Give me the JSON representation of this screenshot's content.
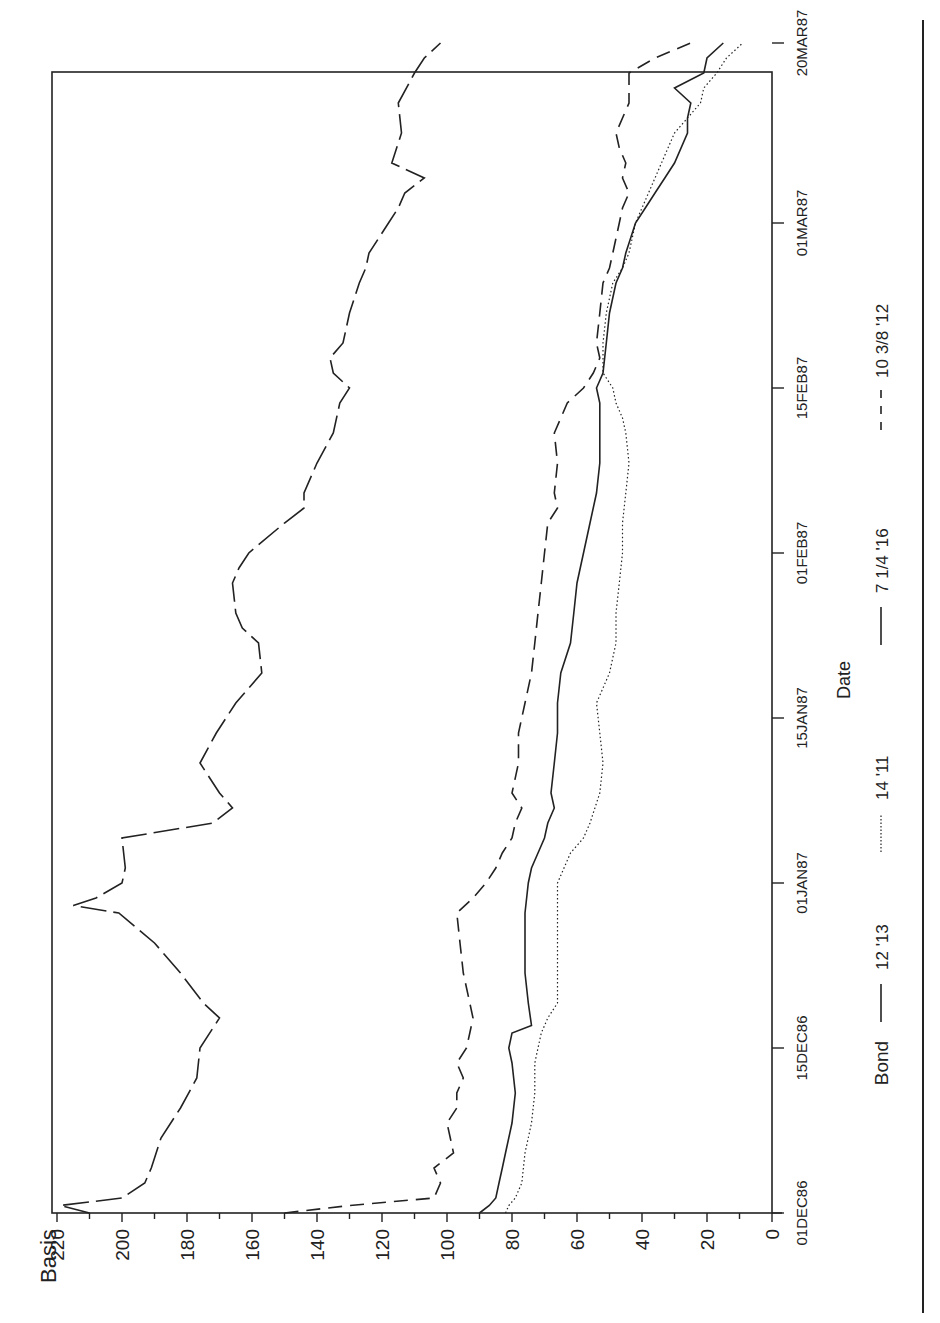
{
  "chart_data": {
    "type": "line",
    "title": "",
    "xlabel": "Date",
    "ylabel": "Basis",
    "orientation": "rotated 90° counter-clockwise (date axis runs bottom-to-top on the right, basis axis along the bottom)",
    "ylim": [
      0,
      220
    ],
    "yticks": [
      0,
      20,
      40,
      60,
      80,
      100,
      120,
      140,
      160,
      180,
      200,
      220
    ],
    "xticks": [
      "01DEC86",
      "15DEC86",
      "01JAN87",
      "15JAN87",
      "01FEB87",
      "15FEB87",
      "01MAR87",
      "20MAR87"
    ],
    "xtick_bday": [
      0,
      11,
      22,
      33,
      44,
      55,
      66,
      78
    ],
    "grid": false,
    "legend_title": "Bond",
    "legend_position": "below x-axis",
    "x_unit": "business day index from 01DEC86",
    "series": [
      {
        "name": "12 '13",
        "style": "solid",
        "x": [
          0,
          0.5,
          1,
          2,
          3,
          4,
          6,
          8,
          10,
          11,
          12,
          12.5,
          14,
          16,
          18,
          20,
          22,
          23,
          24,
          25,
          26,
          27,
          28,
          30,
          32,
          34,
          36,
          38,
          40,
          42,
          44,
          46,
          48,
          50,
          52,
          54,
          55,
          56,
          58,
          60,
          62,
          63,
          64,
          66,
          67,
          68,
          69,
          70,
          72,
          73,
          74,
          75,
          76,
          77,
          78
        ],
        "values": [
          90,
          87,
          85,
          84,
          83,
          82,
          80,
          79,
          80,
          81,
          80,
          74,
          75,
          76,
          76,
          76,
          75,
          74,
          72,
          70,
          69,
          67,
          68,
          67,
          66,
          66,
          65,
          62,
          61,
          60,
          58,
          56,
          54,
          53,
          53,
          53,
          54,
          52,
          51,
          50,
          48,
          46,
          45,
          42,
          39,
          36,
          33,
          30,
          26,
          26,
          25,
          30,
          21,
          20,
          15
        ]
      },
      {
        "name": "14 '11",
        "style": "dotted",
        "x": [
          0,
          0.5,
          1,
          2,
          4,
          6,
          8,
          10,
          11,
          12,
          13,
          14,
          16,
          18,
          20,
          22,
          23,
          24,
          25,
          26,
          28,
          30,
          32,
          34,
          36,
          38,
          40,
          42,
          44,
          46,
          48,
          50,
          52,
          53,
          54,
          55,
          56,
          58,
          60,
          62,
          63,
          64,
          66,
          67,
          68,
          70,
          72,
          74,
          75,
          76,
          77,
          78
        ],
        "values": [
          82,
          81,
          79,
          77,
          76,
          74,
          73,
          73,
          72,
          71,
          69,
          66,
          66,
          66,
          66,
          66,
          64,
          62,
          58,
          56,
          53,
          52,
          53,
          54,
          50,
          48,
          48,
          47,
          46,
          46,
          45,
          44,
          45,
          46,
          48,
          49,
          52,
          52,
          51,
          49,
          46,
          44,
          42,
          40,
          38,
          34,
          30,
          22,
          21,
          17,
          14,
          9
        ]
      },
      {
        "name": "7 1/4 '16",
        "style": "long-dash",
        "x": [
          0,
          0.5,
          1,
          2,
          3,
          5,
          7,
          9,
          11,
          13,
          14,
          16,
          18,
          20,
          20.5,
          21,
          22,
          23,
          25,
          26,
          27,
          28,
          30,
          32,
          34,
          36,
          38,
          39,
          40,
          42,
          43,
          44,
          46,
          47,
          48,
          50,
          52,
          54,
          55,
          56,
          57,
          58,
          60,
          62,
          63,
          64,
          65,
          66,
          67,
          68,
          69,
          70,
          72,
          74,
          76,
          77,
          78
        ],
        "values": [
          210,
          219,
          200,
          193,
          191,
          188,
          182,
          177,
          176,
          170,
          175,
          182,
          190,
          201,
          215,
          208,
          200,
          199,
          200,
          172,
          166,
          170,
          176,
          171,
          165,
          157,
          158,
          163,
          165,
          166,
          164,
          161,
          150,
          144,
          144,
          140,
          135,
          133,
          130,
          135,
          136,
          132,
          130,
          127,
          125,
          124,
          121,
          118,
          115,
          113,
          107,
          117,
          114,
          115,
          110,
          107,
          102
        ]
      },
      {
        "name": "10 3/8 '12",
        "style": "dash",
        "x": [
          0,
          0.5,
          1,
          2,
          3,
          4,
          5,
          6,
          7,
          8,
          9,
          10,
          11,
          12,
          13,
          14,
          16,
          18,
          20,
          21,
          22,
          23,
          24,
          25,
          26,
          27,
          28,
          30,
          32,
          34,
          36,
          38,
          40,
          42,
          44,
          46,
          47,
          48,
          50,
          52,
          54,
          55,
          56,
          57,
          58,
          60,
          62,
          63,
          64,
          66,
          67,
          68,
          69,
          70,
          71,
          72,
          74,
          76,
          77,
          78
        ],
        "values": [
          150,
          130,
          104,
          102,
          104,
          98,
          99,
          100,
          97,
          97,
          95,
          97,
          94,
          93,
          92,
          93,
          95,
          96,
          97,
          92,
          88,
          85,
          83,
          80,
          79,
          77,
          80,
          78,
          78,
          76,
          74,
          73,
          72,
          71,
          70,
          69,
          66,
          67,
          66,
          67,
          63,
          58,
          55,
          53,
          54,
          53,
          52,
          50,
          49,
          47,
          46,
          44,
          46,
          45,
          47,
          48,
          44,
          44,
          36,
          25
        ]
      }
    ]
  },
  "axes": {
    "y_title": "Basis",
    "y_tick_labels": [
      "0",
      "20",
      "40",
      "60",
      "80",
      "100",
      "120",
      "140",
      "160",
      "180",
      "200",
      "220"
    ],
    "x_title": "Date",
    "x_tick_labels": [
      "01DEC86",
      "15DEC86",
      "01JAN87",
      "15JAN87",
      "01FEB87",
      "15FEB87",
      "01MAR87",
      "20MAR87"
    ]
  },
  "legend": {
    "title": "Bond",
    "items": [
      {
        "label": "12 '13",
        "style": "solid"
      },
      {
        "label": "14 '11",
        "style": "dotted"
      },
      {
        "label": "7 1/4 '16",
        "style": "long-dash"
      },
      {
        "label": "10 3/8 '12",
        "style": "dash"
      }
    ]
  },
  "colors": {
    "ink": "#222222",
    "background": "#ffffff"
  }
}
